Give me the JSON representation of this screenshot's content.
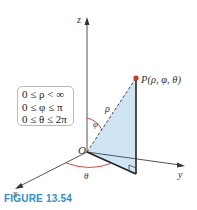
{
  "figure": {
    "caption": "FIGURE 13.54",
    "point_label": "P(ρ, φ, θ)",
    "axes": {
      "z": "z",
      "y": "y",
      "x": "x"
    },
    "origin_label": "O",
    "rho_label": "ρ",
    "phi_label": "φ",
    "theta_label": "θ",
    "ranges": [
      "0 ≤ ρ < ∞",
      "0 ≤ φ ≤ π",
      "0 ≤ θ ≤ 2π"
    ],
    "colors": {
      "accent": "#2a8fd6",
      "point": "#d9342b",
      "fill": "#cfe5f3",
      "angle_arc": "#d9342b"
    }
  }
}
